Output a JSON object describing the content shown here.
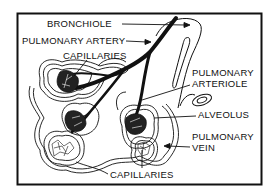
{
  "diagram": {
    "labels": {
      "bronchiole": "BRONCHIOLE",
      "pulmonary_artery": "PULMONARY ARTERY",
      "capillaries_top": "CAPILLARIES",
      "pulmonary_arteriole_line1": "PULMONARY",
      "pulmonary_arteriole_line2": "ARTERIOLE",
      "alveolus": "ALVEOLUS",
      "pulmonary_vein_line1": "PULMONARY",
      "pulmonary_vein_line2": "VEIN",
      "capillaries_bottom": "CAPILLARIES"
    },
    "colors": {
      "ink": "#111111",
      "background": "#ffffff"
    }
  }
}
